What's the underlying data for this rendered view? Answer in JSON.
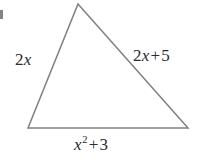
{
  "figure": {
    "kind": "geometry-diagram",
    "shape": "triangle",
    "background_color": "#ffffff",
    "stroke_color": "#808080",
    "stroke_width": 1.5,
    "text_color": "#2b2b2b",
    "width": 199,
    "height": 161,
    "vertices": {
      "apex": {
        "x": 78,
        "y": 4
      },
      "bottom_left": {
        "x": 28,
        "y": 128
      },
      "bottom_right": {
        "x": 188,
        "y": 128
      }
    },
    "polygon_points": "78,4 188,128 28,128"
  },
  "labels": {
    "left_side": {
      "text": "2x",
      "coefficient": "2",
      "variable": "x",
      "position": "left"
    },
    "right_side": {
      "text": "2x + 5",
      "coefficient": "2",
      "variable": "x",
      "operator": "+",
      "constant": "5",
      "position": "right"
    },
    "bottom_side": {
      "text": "x2 + 3",
      "variable": "x",
      "exponent": "2",
      "operator": "+",
      "constant": "3",
      "position": "bottom"
    }
  },
  "artifact": {
    "name": "page-edge-mark",
    "color": "#6e6e6e"
  }
}
